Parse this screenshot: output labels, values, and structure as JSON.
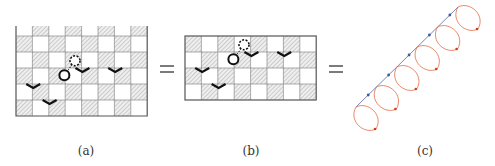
{
  "figure": {
    "panels": [
      {
        "id": "a",
        "caption": "(a)",
        "grid": {
          "cols": 8,
          "rows": 5,
          "partial_top_row": true
        },
        "defects": [
          {
            "type": "circle",
            "col": 2,
            "row": 2
          },
          {
            "type": "dashed-circle",
            "col": 3,
            "row": 1
          }
        ],
        "chevrons": [
          {
            "col": 4,
            "row": 2
          },
          {
            "col": 6,
            "row": 2
          },
          {
            "col": 1,
            "row": 3
          },
          {
            "col": 2,
            "row": 4
          }
        ]
      },
      {
        "id": "b",
        "caption": "(b)",
        "grid": {
          "cols": 8,
          "rows": 4,
          "partial_top_row": false
        },
        "defects": [
          {
            "type": "circle",
            "col": 2,
            "row": 1
          },
          {
            "type": "dashed-circle",
            "col": 3,
            "row": 0
          }
        ],
        "chevrons": [
          {
            "col": 4,
            "row": 1
          },
          {
            "col": 6,
            "row": 1
          },
          {
            "col": 1,
            "row": 2
          },
          {
            "col": 2,
            "row": 3
          }
        ]
      },
      {
        "id": "c",
        "caption": "(c)",
        "helix": {
          "loops": 6,
          "line_color": "#5a6a9a",
          "loop_color": "#e0643c",
          "dot_color": "#3a5aa8"
        }
      }
    ],
    "equals_signs": [
      "=",
      "="
    ],
    "colors": {
      "grid_line": "#555555",
      "hatch": "#9a9a9a",
      "defect": "#111111"
    }
  }
}
